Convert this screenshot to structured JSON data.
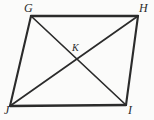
{
  "figure": {
    "kind": "geometry-diagram",
    "shape_name": "quadrilateral-GHIJ",
    "background_color": "#fbfbfa",
    "stroke_color": "#2b2b2b",
    "label_color": "#2b2b2b",
    "canvas": {
      "width": 154,
      "height": 120
    },
    "vertices": [
      {
        "id": "G",
        "label": "G",
        "x": 31,
        "y": 16,
        "position": "top-left"
      },
      {
        "id": "H",
        "label": "H",
        "x": 138,
        "y": 16,
        "position": "top-right"
      },
      {
        "id": "I",
        "label": "I",
        "x": 126,
        "y": 105,
        "position": "bottom-right"
      },
      {
        "id": "J",
        "label": "J",
        "x": 10,
        "y": 106,
        "position": "bottom-left"
      }
    ],
    "interior_points": [
      {
        "id": "K",
        "label": "K",
        "x": 75,
        "y": 60,
        "description": "intersection-of-diagonals"
      }
    ],
    "sides": [
      {
        "id": "GH",
        "from": "G",
        "to": "H",
        "label": ""
      },
      {
        "id": "HI",
        "from": "H",
        "to": "I",
        "label": ""
      },
      {
        "id": "IJ",
        "from": "I",
        "to": "J",
        "label": ""
      },
      {
        "id": "JG",
        "from": "J",
        "to": "G",
        "label": ""
      }
    ],
    "diagonals": [
      {
        "id": "GI",
        "from": "G",
        "to": "I",
        "label": ""
      },
      {
        "id": "HJ",
        "from": "H",
        "to": "J",
        "label": ""
      }
    ],
    "side_stroke_width": 2.1,
    "diagonal_stroke_width": 1.7
  }
}
